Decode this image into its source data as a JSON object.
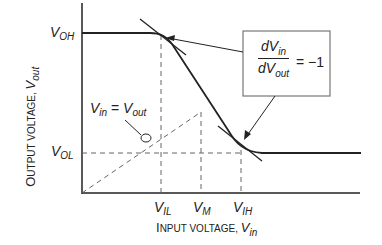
{
  "diagram": {
    "y_axis": {
      "label_prefix": "O",
      "label_rest": "UTPUT VOLTAGE, ",
      "var": "V",
      "var_sub": "out"
    },
    "x_axis": {
      "label_prefix": "I",
      "label_rest": "NPUT VOLTAGE, ",
      "var": "V",
      "var_sub": "in"
    },
    "levels": {
      "voh": {
        "var": "V",
        "sub": "OH"
      },
      "vol": {
        "var": "V",
        "sub": "OL"
      }
    },
    "x_ticks": [
      {
        "var": "V",
        "sub": "IL"
      },
      {
        "var": "V",
        "sub": "M"
      },
      {
        "var": "V",
        "sub": "IH"
      }
    ],
    "unity_line_label": {
      "lhs_var": "V",
      "lhs_sub": "in",
      "eq": " = ",
      "rhs_var": "V",
      "rhs_sub": "out"
    },
    "gain_box": {
      "num_var": "dV",
      "num_sub": "in",
      "den_var": "dV",
      "den_sub": "out",
      "rhs": "= −1"
    },
    "colors": {
      "line": "#222222",
      "dash": "#555555",
      "box_border": "#777777"
    }
  }
}
